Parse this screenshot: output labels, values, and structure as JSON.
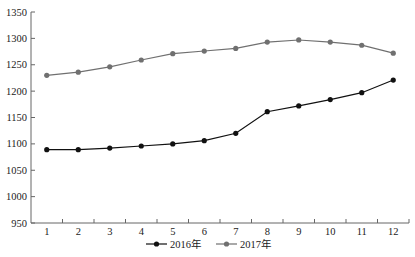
{
  "chart_data": {
    "type": "line",
    "title": "",
    "xlabel": "",
    "ylabel": "",
    "categories": [
      "1",
      "2",
      "3",
      "4",
      "5",
      "6",
      "7",
      "8",
      "9",
      "10",
      "11",
      "12"
    ],
    "series": [
      {
        "name": "2016年",
        "color": "#111111",
        "values": [
          1089,
          1089,
          1092,
          1096,
          1100,
          1106,
          1120,
          1161,
          1172,
          1184,
          1197,
          1221
        ]
      },
      {
        "name": "2017年",
        "color": "#707070",
        "values": [
          1230,
          1236,
          1246,
          1259,
          1271,
          1276,
          1281,
          1293,
          1297,
          1293,
          1287,
          1272
        ]
      }
    ],
    "ylim": [
      950,
      1350
    ],
    "yticks": [
      950,
      1000,
      1050,
      1100,
      1150,
      1200,
      1250,
      1300,
      1350
    ],
    "grid": false,
    "legend_position": "bottom"
  }
}
